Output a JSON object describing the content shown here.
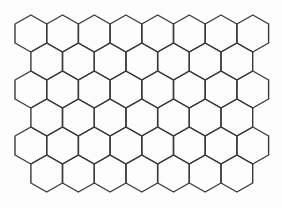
{
  "diagram": {
    "type": "hexagonal-grid",
    "orientation": "pointy-top",
    "rows": 6,
    "columns_odd_rows": 8,
    "columns_even_rows": 7,
    "origin_x": 15,
    "origin_y": 15,
    "hex_width": 31.7,
    "row_pitch": 28,
    "shoulder_offset": 9,
    "side_length": 19,
    "colors": {
      "background": "#fdfdfd",
      "stroke": "#3a3a3a"
    }
  }
}
